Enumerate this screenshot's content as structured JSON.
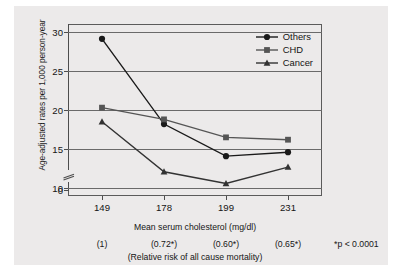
{
  "chart_data": {
    "type": "line",
    "title": "",
    "xlabel": "Mean serum cholesterol (mg/dl)",
    "ylabel": "Age-adjusted rates per 1,000 person-year",
    "categories": [
      "149",
      "178",
      "199",
      "231"
    ],
    "x_tick_labels": [
      "149",
      "178",
      "199",
      "231"
    ],
    "y_tick_labels": [
      "0",
      "10",
      "15",
      "20",
      "25",
      "30"
    ],
    "ylim": [
      9.0,
      31.0
    ],
    "y_axis_break": true,
    "y_axis_break_note": "axis broken between 0 and 10",
    "grid": "horizontal",
    "legend_position": "top-right",
    "series": [
      {
        "name": "Others",
        "marker": "circle",
        "color": "#1a1a1a",
        "values": [
          29.1,
          18.2,
          14.1,
          14.6
        ]
      },
      {
        "name": "CHD",
        "marker": "square",
        "color": "#555555",
        "values": [
          20.3,
          18.8,
          16.5,
          16.2
        ]
      },
      {
        "name": "Cancer",
        "marker": "triangle",
        "color": "#333333",
        "values": [
          18.5,
          12.1,
          10.6,
          12.7
        ]
      }
    ],
    "annotations": {
      "relative_risk_values": [
        "(1)",
        "(0.72*)",
        "(0.60*)",
        "(0.65*)"
      ],
      "relative_risk_caption": "(Relative risk of all cause mortality)",
      "p_value_note": "*p < 0.0001"
    },
    "colors": {
      "background": "#eceaea",
      "page": "#ffffff",
      "axis": "#4d4d4d",
      "grid": "#6a6a6a",
      "text": "#161616"
    }
  }
}
